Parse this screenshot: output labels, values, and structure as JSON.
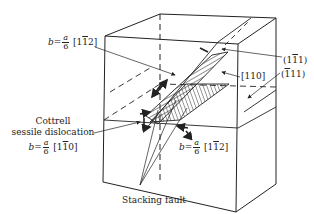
{
  "labels": {
    "burgers_top": {
      "b": "b",
      "eq": "=",
      "num": "a",
      "den": "6",
      "vec_pre": "[1",
      "vec_bar": "1",
      "vec_post": "2]"
    },
    "plane_1m11": {
      "pre": "(1",
      "bar": "1",
      "post": "1)"
    },
    "direction_110": "[110]",
    "plane_m111": {
      "pre": "(",
      "bar": "1",
      "post": "11)"
    },
    "cottrell": {
      "line1": "Cottrell",
      "line2": "sessile dislocation",
      "b": "b",
      "eq": "=",
      "num": "a",
      "den": "6",
      "vec_pre": "[1",
      "vec_bar": "1",
      "vec_post": "0]"
    },
    "burgers_bottom": {
      "b": "b",
      "eq": "=",
      "num": "a",
      "den": "6",
      "vec_pre": "[1",
      "vec_bar": "1",
      "vec_post": "2]"
    },
    "stacking_fault": "Stacking fault"
  },
  "colors": {
    "line": "#222222",
    "background": "#ffffff"
  }
}
